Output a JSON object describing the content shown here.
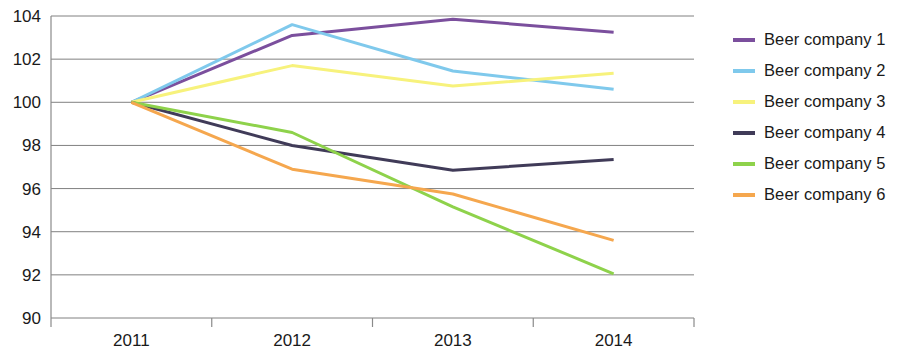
{
  "chart_data": {
    "type": "line",
    "title": "",
    "xlabel": "",
    "ylabel": "",
    "categories": [
      "2011",
      "2012",
      "2013",
      "2014"
    ],
    "ylim": [
      90,
      104
    ],
    "ytick_labels": [
      "104",
      "102",
      "100",
      "98",
      "96",
      "94",
      "92",
      "90"
    ],
    "ytick_values": [
      104,
      102,
      100,
      98,
      96,
      94,
      92,
      90
    ],
    "grid": true,
    "legend_position": "right",
    "series": [
      {
        "name": "Beer company 1",
        "color": "#7b4f9d",
        "values": [
          100,
          103.1,
          103.85,
          103.25
        ]
      },
      {
        "name": "Beer company 2",
        "color": "#7fc9ec",
        "values": [
          100,
          103.6,
          101.45,
          100.6
        ]
      },
      {
        "name": "Beer company 3",
        "color": "#f7f27c",
        "values": [
          100,
          101.7,
          100.75,
          101.35
        ]
      },
      {
        "name": "Beer company 4",
        "color": "#403b58",
        "values": [
          100,
          98.0,
          96.85,
          97.35
        ]
      },
      {
        "name": "Beer company 5",
        "color": "#8ed24b",
        "values": [
          100,
          98.6,
          95.15,
          92.05
        ]
      },
      {
        "name": "Beer company 6",
        "color": "#f5a74e",
        "values": [
          100,
          96.9,
          95.75,
          93.6
        ]
      }
    ]
  },
  "legend": {
    "items": [
      {
        "label": "Beer company 1",
        "color": "#7b4f9d"
      },
      {
        "label": "Beer company 2",
        "color": "#7fc9ec"
      },
      {
        "label": "Beer company 3",
        "color": "#f7f27c"
      },
      {
        "label": "Beer company 4",
        "color": "#403b58"
      },
      {
        "label": "Beer company 5",
        "color": "#8ed24b"
      },
      {
        "label": "Beer company 6",
        "color": "#f5a74e"
      }
    ]
  }
}
